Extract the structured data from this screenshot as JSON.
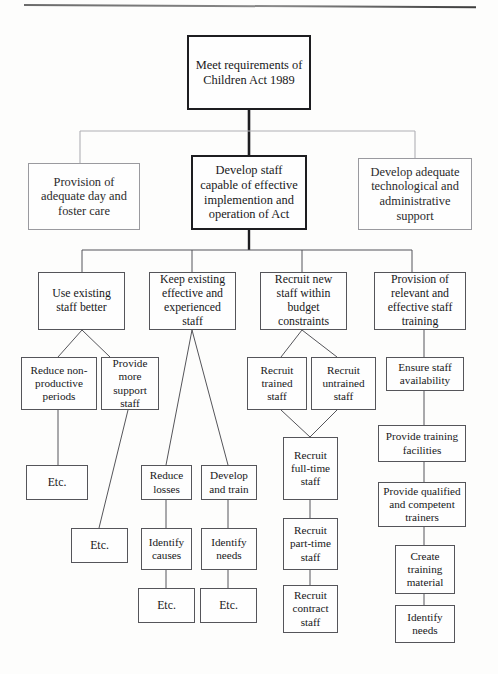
{
  "page": {
    "background_color": "#fdfdfc",
    "line_color": "#55555a",
    "faint_line_color": "#9a9a9f",
    "emphasis_color": "#1d1d20"
  },
  "nodes": {
    "root": "Meet requirements of Children Act 1989",
    "level2_left": "Provision of adequate day and foster care",
    "level2_center": "Develop staff capable of effective implemention and operation of Act",
    "level2_right": "Develop adequate technological and administrative support",
    "level3_a": "Use existing staff better",
    "level3_b": "Keep existing effective and experienced staff",
    "level3_c": "Recruit new staff within budget constraints",
    "level3_d": "Provision of relevant and effective staff training",
    "level4_a1": "Reduce non-productive periods",
    "level4_a2": "Provide more support staff",
    "level4_c1": "Recruit trained staff",
    "level4_c2": "Recruit untrained staff",
    "level4_d1": "Ensure staff availability",
    "level5_a1": "Etc.",
    "level5_b1": "Reduce losses",
    "level5_b2": "Develop and train",
    "level5_c1": "Recruit full-time staff",
    "level5_d1": "Provide training facilities",
    "level6_a2": "Etc.",
    "level6_b1": "Identify causes",
    "level6_b2": "Identify needs",
    "level6_c1": "Recruit part-time staff",
    "level6_d1": "Provide qualified and competent trainers",
    "level7_b1": "Etc.",
    "level7_b2": "Etc.",
    "level7_c1": "Recruit contract staff",
    "level7_d1": "Create training material",
    "level8_d1": "Identify needs"
  }
}
